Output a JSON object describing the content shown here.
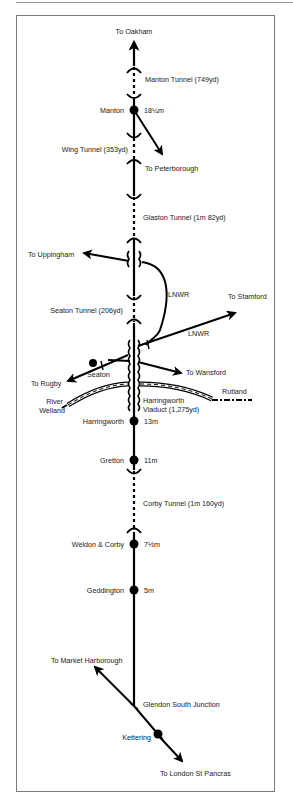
{
  "diagram": {
    "colors": {
      "line": "#000000",
      "text": "#1a1a1a",
      "frame": "#7a7a7a"
    },
    "destinations": {
      "oakham": "To Oakham",
      "peterborough": "To Peterborough",
      "uppingham": "To Uppingham",
      "stamford": "To Stamford",
      "rugby": "To Rugby",
      "wansford": "To Wansford",
      "market_harborough": "To Market Harborough",
      "london": "To London St Pancras"
    },
    "tunnels": {
      "manton": "Manton Tunnel (749yd)",
      "wing": "Wing Tunnel (353yd)",
      "glaston": "Glaston Tunnel (1m 82yd)",
      "seaton": "Seaton Tunnel (206yd)",
      "corby": "Corby Tunnel (1m 160yd)"
    },
    "stations": [
      {
        "name": "Manton",
        "mileage": "18¼m"
      },
      {
        "name": "Seaton",
        "mileage": ""
      },
      {
        "name": "Harringworth",
        "mileage": "13m"
      },
      {
        "name": "Gretton",
        "mileage": "11m"
      },
      {
        "name": "Weldon & Corby",
        "mileage": "7½m"
      },
      {
        "name": "Geddington",
        "mileage": "5m"
      },
      {
        "name": "Kettering",
        "mileage": ""
      }
    ],
    "junctions": {
      "glendon": "Glendon South Junction"
    },
    "other_railways": {
      "lnwr_1": "LNWR",
      "lnwr_2": "LNWR"
    },
    "viaduct": {
      "line1": "Harringworth",
      "line2": "Viaduct (1,275yd)"
    },
    "river": {
      "line1": "River",
      "line2": "Welland"
    },
    "county": "Rutland"
  }
}
